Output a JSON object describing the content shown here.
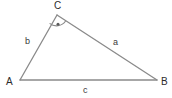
{
  "figure": {
    "background_color": "#ffffff",
    "line_color": "#8a8a8a",
    "text_color": "#2f2f2f",
    "width": 172,
    "height": 98
  },
  "vertices": [
    {
      "label": "A",
      "x": 20,
      "y": 80,
      "label_x": 6,
      "label_y": 77
    },
    {
      "label": "B",
      "x": 157,
      "y": 80,
      "label_x": 161,
      "label_y": 77
    },
    {
      "label": "C",
      "x": 57,
      "y": 15,
      "label_x": 54,
      "label_y": 1
    }
  ],
  "sides": [
    {
      "label": "a",
      "from": "B",
      "to": "C",
      "label_x": 113,
      "label_y": 38
    },
    {
      "label": "b",
      "from": "A",
      "to": "C",
      "label_x": 25,
      "label_y": 37
    },
    {
      "label": "c",
      "from": "A",
      "to": "B",
      "label_x": 83,
      "label_y": 86
    }
  ],
  "angle_marks": [
    {
      "at_vertex": "C",
      "style": "arc-with-dot",
      "radius": 11
    }
  ],
  "geometry": {
    "edge_A_to_B": "M 20 80 L 157 80",
    "edge_A_to_C": "M 20 80 L 57 15",
    "edge_C_to_B": "M 57 15 L 157 80",
    "arc_path": "M 49.6 23.4 A 11 11 0 0 0 65.6 21.0",
    "dot_cx": 58.0,
    "dot_cy": 24.2,
    "dot_r": 1.5
  }
}
